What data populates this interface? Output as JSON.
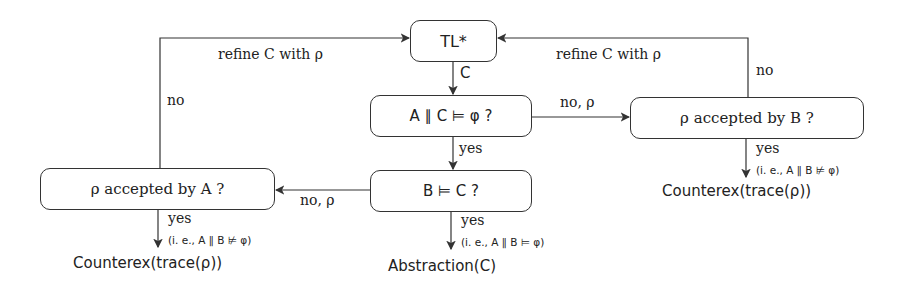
{
  "nodes": {
    "tl": {
      "label": "TL*"
    },
    "check_ac": {
      "label": "A ∥ C ⊨ φ ?"
    },
    "check_b": {
      "label": "B ⊨ C ?"
    },
    "accepted_b": {
      "label": "ρ accepted by B ?"
    },
    "accepted_a": {
      "label": "ρ accepted by A ?"
    }
  },
  "edges": {
    "tl_to_ac": "C",
    "ac_yes": "yes",
    "ac_no": "no, ρ",
    "b_no": "no, ρ",
    "refine_left": "refine C with ρ",
    "refine_right": "refine C with ρ",
    "a_no": "no",
    "b_acc_no": "no",
    "a_yes": "yes",
    "a_yes_note": "(i. e., A ∥ B ⊭ φ)",
    "bc_yes": "yes",
    "bc_yes_note": "(i. e., A ∥ B ⊨ φ)",
    "bacc_yes": "yes",
    "bacc_yes_note": "(i. e., A ∥ B ⊭ φ)"
  },
  "outcomes": {
    "counterex_left": "Counterex(trace(ρ))",
    "abstraction": "Abstraction(C)",
    "counterex_right": "Counterex(trace(ρ))"
  }
}
